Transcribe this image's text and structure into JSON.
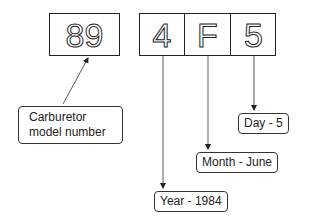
{
  "diagram": {
    "model_box": {
      "value": "89"
    },
    "date_code": {
      "cells": [
        "4",
        "F",
        "5"
      ]
    },
    "labels": {
      "model": {
        "line1": "Carburetor",
        "line2": "model number"
      },
      "day": "Day - 5",
      "month": "Month - June",
      "year": "Year - 1984"
    },
    "colors": {
      "stroke": "#222222",
      "background": "#ffffff"
    }
  }
}
